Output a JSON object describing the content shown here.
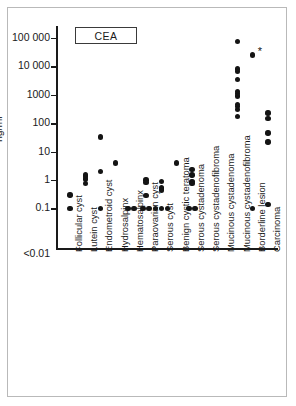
{
  "figure": {
    "legend_label": "CEA",
    "axis_title": "ng/ml"
  },
  "chart_data": {
    "type": "scatter",
    "title": "CEA",
    "xlabel": "",
    "ylabel": "ng/ml",
    "yscale": "log",
    "ylim": [
      0.01,
      100000
    ],
    "ytick_labels": [
      "100 000",
      "10 000",
      "1000",
      "100",
      "10",
      "1",
      "0.1",
      "<0.01"
    ],
    "ytick_values": [
      100000,
      10000,
      1000,
      100,
      10,
      1,
      0.1,
      0.01
    ],
    "grid": false,
    "legend": "none",
    "annotations": [
      {
        "text": "*",
        "near_category": "Borderline lesion",
        "value": 25000
      }
    ],
    "categories": [
      "Follicular cyst",
      "Lutein cyst",
      "Endometroid cyst",
      "Hydrosalpinx",
      "Hematosalpinx",
      "Paraovarian cyst",
      "Serous cyst",
      "Benign cystic teratoma",
      "Serous cystadenoma",
      "Serous cystadenofibroma",
      "Mucinous cystadenoma",
      "Mucinous cystadenofibroma",
      "Borderline lesion",
      "Carcinoma"
    ],
    "series": [
      {
        "name": "CEA",
        "points": [
          {
            "category": "Follicular cyst",
            "values": [
              0.3,
              0.1
            ]
          },
          {
            "category": "Lutein cyst",
            "values": [
              1.5,
              1.3,
              1.1,
              0.75
            ]
          },
          {
            "category": "Endometroid cyst",
            "values": [
              33,
              2.0,
              0.1
            ]
          },
          {
            "category": "Hydrosalpinx",
            "values": [
              4.0
            ]
          },
          {
            "category": "Hematosalpinx",
            "values": [
              0.1,
              0.1
            ]
          },
          {
            "category": "Paraovarian cyst",
            "values": [
              1.0,
              0.8,
              0.28,
              0.1,
              0.1
            ]
          },
          {
            "category": "Serous cyst",
            "values": [
              0.9,
              0.55,
              0.5,
              0.45,
              0.1,
              0.1,
              0.1
            ]
          },
          {
            "category": "Benign cystic teratoma",
            "values": [
              4.0
            ]
          },
          {
            "category": "Serous cystadenoma",
            "values": [
              2.4,
              1.5,
              0.9,
              0.75,
              0.1,
              0.1
            ]
          },
          {
            "category": "Serous cystadenofibroma",
            "values": []
          },
          {
            "category": "Mucinous cystadenoma",
            "values": []
          },
          {
            "category": "Mucinous cystadenofibroma",
            "values": [
              75000,
              8000,
              6500,
              3500,
              1300,
              1100,
              900,
              450,
              380,
              300,
              170
            ]
          },
          {
            "category": "Borderline lesion",
            "values": [
              25000,
              0.1
            ]
          },
          {
            "category": "Carcinoma",
            "values": [
              230,
              150,
              45,
              22,
              0.14
            ]
          }
        ]
      }
    ]
  },
  "y_axis": {
    "ticks": [
      {
        "label": "100 000",
        "value": 100000
      },
      {
        "label": "10 000",
        "value": 10000
      },
      {
        "label": "1000",
        "value": 1000
      },
      {
        "label": "100",
        "value": 100
      },
      {
        "label": "10",
        "value": 10
      },
      {
        "label": "1",
        "value": 1
      },
      {
        "label": "0.1",
        "value": 0.1
      },
      {
        "label": "<0.01",
        "value": 0.01
      }
    ]
  }
}
